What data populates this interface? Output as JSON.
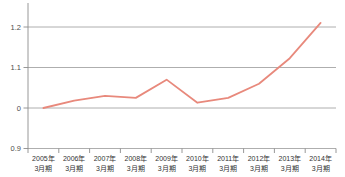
{
  "chart": {
    "title": "",
    "line_color": "#e8897c",
    "grid_color": "#999999",
    "axis_color": "#8c8c8c",
    "y_label_color": "#4d4d4d",
    "x_label_color": "#333333",
    "background": "#ffffff"
  },
  "chart_data": {
    "type": "line",
    "categories": [
      "2005年",
      "2006年",
      "2007年",
      "2008年",
      "2009年",
      "2010年",
      "2011年",
      "2012年",
      "2013年",
      "2014年"
    ],
    "category_sub_label": "3月期",
    "values": [
      1.0,
      1.018,
      1.03,
      1.025,
      1.07,
      1.013,
      1.025,
      1.06,
      1.123,
      1.21
    ],
    "title": "",
    "xlabel": "",
    "ylabel": "",
    "ylim": [
      0.9,
      1.2
    ],
    "y_ticks": [
      {
        "value": 1.2,
        "label": "1.2"
      },
      {
        "value": 1.1,
        "label": "1.1"
      },
      {
        "value": 1.0,
        "label": "0"
      },
      {
        "value": 0.9,
        "label": "0.9"
      }
    ],
    "grid": true,
    "legend": "none"
  }
}
